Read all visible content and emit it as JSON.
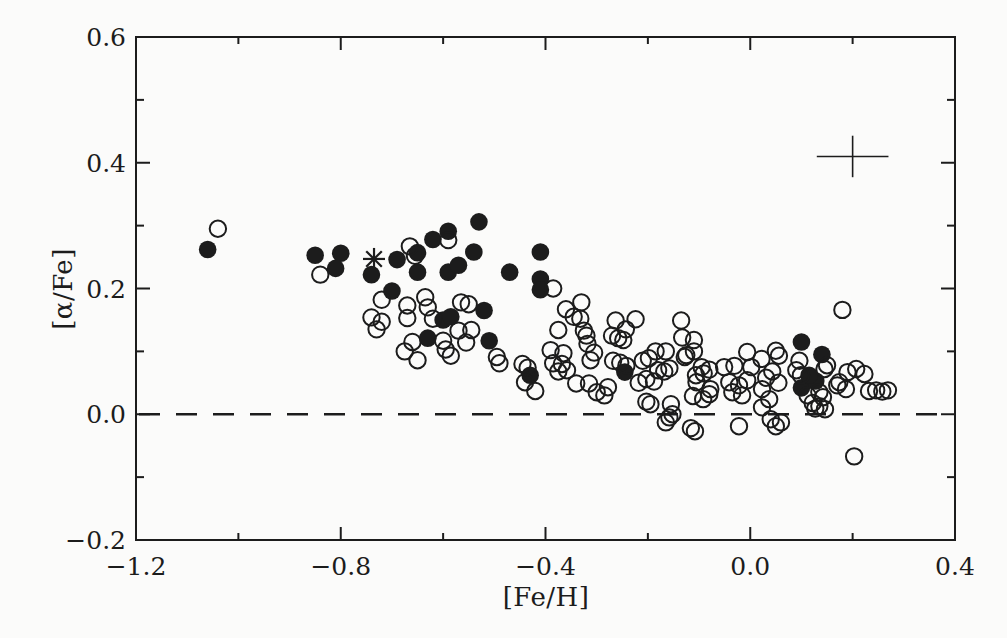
{
  "figure": {
    "background": "#fbfbfa",
    "ink_color": "#1c1c1c"
  },
  "chart_data": {
    "type": "scatter",
    "title": "",
    "xlabel": "[Fe/H]",
    "ylabel": "[α/Fe]",
    "xlim": [
      -1.2,
      0.4
    ],
    "ylim": [
      -0.2,
      0.6
    ],
    "grid": false,
    "legend": "none",
    "x_major_ticks": [
      -1.2,
      -0.8,
      -0.4,
      0.0,
      0.4
    ],
    "x_tick_labels": [
      "−1.2",
      "−0.8",
      "−0.4",
      "0.0",
      "0.4"
    ],
    "x_minor_ticks": [
      -1.0,
      -0.6,
      -0.2,
      0.2
    ],
    "y_major_ticks": [
      0.6,
      0.4,
      0.2,
      0.0,
      -0.2
    ],
    "y_tick_labels": [
      "0.6",
      "0.4",
      "0.2",
      "0.0",
      "−0.2"
    ],
    "y_minor_ticks": [
      0.5,
      0.3,
      0.1,
      -0.1
    ],
    "reference_line": {
      "y": 0.0,
      "style": "dashed"
    },
    "error_cross": {
      "x": 0.2,
      "y": 0.41,
      "xerr": 0.07,
      "yerr": 0.033
    },
    "series": [
      {
        "name": "filled-circles",
        "marker": "filled-circle",
        "points": [
          [
            -1.06,
            0.262
          ],
          [
            -0.85,
            0.253
          ],
          [
            -0.8,
            0.256
          ],
          [
            -0.81,
            0.232
          ],
          [
            -0.74,
            0.222
          ],
          [
            -0.69,
            0.246
          ],
          [
            -0.65,
            0.226
          ],
          [
            -0.65,
            0.257
          ],
          [
            -0.62,
            0.278
          ],
          [
            -0.59,
            0.291
          ],
          [
            -0.59,
            0.226
          ],
          [
            -0.7,
            0.196
          ],
          [
            -0.53,
            0.306
          ],
          [
            -0.54,
            0.258
          ],
          [
            -0.57,
            0.237
          ],
          [
            -0.6,
            0.15
          ],
          [
            -0.585,
            0.155
          ],
          [
            -0.63,
            0.121
          ],
          [
            -0.51,
            0.117
          ],
          [
            -0.52,
            0.165
          ],
          [
            -0.47,
            0.226
          ],
          [
            -0.41,
            0.258
          ],
          [
            -0.41,
            0.215
          ],
          [
            -0.41,
            0.198
          ],
          [
            -0.43,
            0.062
          ],
          [
            -0.245,
            0.067
          ],
          [
            0.1,
            0.115
          ],
          [
            0.14,
            0.095
          ],
          [
            0.1,
            0.042
          ],
          [
            0.128,
            0.053
          ],
          [
            0.115,
            0.062
          ]
        ]
      },
      {
        "name": "open-circles",
        "marker": "open-circle",
        "points": [
          [
            -1.04,
            0.295
          ],
          [
            -0.84,
            0.222
          ],
          [
            -0.665,
            0.267
          ],
          [
            -0.655,
            0.252
          ],
          [
            -0.59,
            0.277
          ],
          [
            -0.72,
            0.182
          ],
          [
            -0.67,
            0.173
          ],
          [
            -0.635,
            0.186
          ],
          [
            -0.63,
            0.17
          ],
          [
            -0.74,
            0.154
          ],
          [
            -0.72,
            0.147
          ],
          [
            -0.73,
            0.135
          ],
          [
            -0.67,
            0.153
          ],
          [
            -0.565,
            0.178
          ],
          [
            -0.55,
            0.175
          ],
          [
            -0.62,
            0.152
          ],
          [
            -0.57,
            0.133
          ],
          [
            -0.545,
            0.134
          ],
          [
            -0.555,
            0.114
          ],
          [
            -0.6,
            0.117
          ],
          [
            -0.595,
            0.103
          ],
          [
            -0.585,
            0.093
          ],
          [
            -0.66,
            0.115
          ],
          [
            -0.675,
            0.1
          ],
          [
            -0.65,
            0.086
          ],
          [
            -0.49,
            0.081
          ],
          [
            -0.495,
            0.091
          ],
          [
            -0.445,
            0.08
          ],
          [
            -0.435,
            0.074
          ],
          [
            -0.44,
            0.051
          ],
          [
            -0.42,
            0.037
          ],
          [
            -0.39,
            0.102
          ],
          [
            -0.365,
            0.097
          ],
          [
            -0.385,
            0.081
          ],
          [
            -0.368,
            0.08
          ],
          [
            -0.375,
            0.068
          ],
          [
            -0.358,
            0.07
          ],
          [
            -0.34,
            0.049
          ],
          [
            -0.385,
            0.2
          ],
          [
            -0.33,
            0.178
          ],
          [
            -0.36,
            0.167
          ],
          [
            -0.345,
            0.155
          ],
          [
            -0.332,
            0.152
          ],
          [
            -0.375,
            0.134
          ],
          [
            -0.325,
            0.133
          ],
          [
            -0.32,
            0.125
          ],
          [
            -0.318,
            0.112
          ],
          [
            -0.305,
            0.098
          ],
          [
            -0.312,
            0.086
          ],
          [
            -0.315,
            0.049
          ],
          [
            -0.3,
            0.035
          ],
          [
            -0.285,
            0.03
          ],
          [
            -0.278,
            0.043
          ],
          [
            -0.263,
            0.149
          ],
          [
            -0.224,
            0.151
          ],
          [
            -0.27,
            0.125
          ],
          [
            -0.258,
            0.121
          ],
          [
            -0.248,
            0.118
          ],
          [
            -0.243,
            0.135
          ],
          [
            -0.268,
            0.085
          ],
          [
            -0.254,
            0.082
          ],
          [
            -0.242,
            0.077
          ],
          [
            -0.21,
            0.085
          ],
          [
            -0.198,
            0.089
          ],
          [
            -0.185,
            0.1
          ],
          [
            -0.165,
            0.1
          ],
          [
            -0.18,
            0.07
          ],
          [
            -0.168,
            0.068
          ],
          [
            -0.158,
            0.073
          ],
          [
            -0.218,
            0.05
          ],
          [
            -0.203,
            0.056
          ],
          [
            -0.188,
            0.052
          ],
          [
            -0.135,
            0.149
          ],
          [
            -0.133,
            0.122
          ],
          [
            -0.128,
            0.091
          ],
          [
            -0.11,
            0.1
          ],
          [
            -0.105,
            0.051
          ],
          [
            -0.112,
            0.029
          ],
          [
            -0.195,
            0.016
          ],
          [
            -0.203,
            0.02
          ],
          [
            -0.165,
            -0.013
          ],
          [
            -0.155,
            0.016
          ],
          [
            -0.152,
            0.0
          ],
          [
            -0.158,
            -0.005
          ],
          [
            -0.116,
            -0.022
          ],
          [
            -0.108,
            -0.027
          ],
          [
            -0.106,
            0.062
          ],
          [
            -0.091,
            0.065
          ],
          [
            -0.11,
            0.118
          ],
          [
            -0.125,
            0.094
          ],
          [
            -0.095,
            0.075
          ],
          [
            -0.08,
            0.071
          ],
          [
            -0.078,
            0.04
          ],
          [
            -0.08,
            0.032
          ],
          [
            -0.092,
            0.024
          ],
          [
            -0.051,
            0.075
          ],
          [
            -0.031,
            0.077
          ],
          [
            -0.041,
            0.051
          ],
          [
            -0.035,
            0.035
          ],
          [
            -0.022,
            -0.019
          ],
          [
            -0.006,
            0.099
          ],
          [
            0.002,
            0.075
          ],
          [
            -0.006,
            0.054
          ],
          [
            -0.022,
            0.046
          ],
          [
            -0.016,
            0.03
          ],
          [
            0.023,
            0.04
          ],
          [
            0.037,
            0.024
          ],
          [
            0.05,
            0.101
          ],
          [
            0.056,
            0.093
          ],
          [
            0.023,
            0.011
          ],
          [
            0.04,
            -0.008
          ],
          [
            0.05,
            -0.019
          ],
          [
            0.06,
            -0.013
          ],
          [
            0.031,
            0.058
          ],
          [
            0.043,
            0.068
          ],
          [
            0.022,
            0.088
          ],
          [
            0.055,
            0.05
          ],
          [
            0.09,
            0.07
          ],
          [
            0.096,
            0.085
          ],
          [
            0.099,
            0.062
          ],
          [
            0.145,
            0.072
          ],
          [
            0.15,
            0.078
          ],
          [
            0.18,
            0.166
          ],
          [
            0.207,
            0.072
          ],
          [
            0.223,
            0.064
          ],
          [
            0.17,
            0.046
          ],
          [
            0.187,
            0.04
          ],
          [
            0.232,
            0.037
          ],
          [
            0.246,
            0.038
          ],
          [
            0.258,
            0.036
          ],
          [
            0.269,
            0.038
          ],
          [
            0.135,
            0.035
          ],
          [
            0.142,
            0.027
          ],
          [
            0.135,
            0.013
          ],
          [
            0.146,
            0.008
          ],
          [
            0.112,
            0.03
          ],
          [
            0.122,
            0.018
          ],
          [
            0.127,
            0.009
          ],
          [
            0.203,
            -0.067
          ],
          [
            0.174,
            0.051
          ],
          [
            0.19,
            0.067
          ]
        ]
      },
      {
        "name": "asterisk",
        "marker": "asterisk",
        "points": [
          [
            -0.735,
            0.247
          ]
        ]
      }
    ]
  }
}
